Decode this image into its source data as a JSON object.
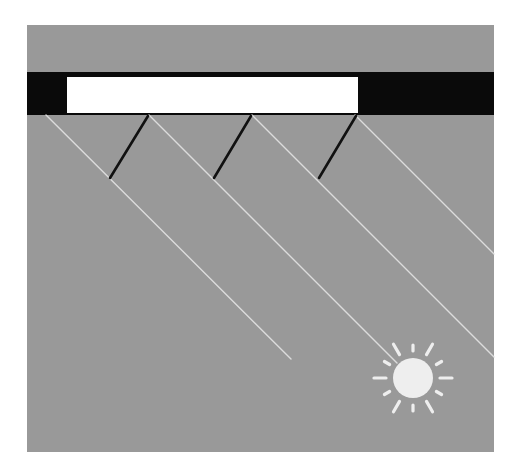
{
  "diagram": {
    "type": "illustration",
    "colors": {
      "background": "#ffffff",
      "panel": "#999999",
      "bar": "#0a0a0a",
      "window": "#ffffff",
      "rays": "#dcdcdc",
      "wavefronts": "#111111",
      "sun": "#eeeeee"
    },
    "elements": {
      "panel": {
        "x": 27,
        "y": 25,
        "w": 467,
        "h": 427
      },
      "bar": {
        "x": 27,
        "y": 72,
        "w": 467,
        "h": 43
      },
      "window": {
        "x": 67,
        "y": 77,
        "w": 291,
        "h": 36
      },
      "rays": [
        {
          "x1": 46,
          "y1": 115,
          "x2": 291,
          "y2": 359
        },
        {
          "x1": 149,
          "y1": 115,
          "x2": 397,
          "y2": 363
        },
        {
          "x1": 252,
          "y1": 115,
          "x2": 494,
          "y2": 357
        },
        {
          "x1": 355,
          "y1": 115,
          "x2": 494,
          "y2": 254
        }
      ],
      "wavefronts": [
        {
          "x1": 148,
          "y1": 116,
          "x2": 110,
          "y2": 178
        },
        {
          "x1": 251,
          "y1": 116,
          "x2": 214,
          "y2": 178
        },
        {
          "x1": 356,
          "y1": 116,
          "x2": 319,
          "y2": 178
        }
      ],
      "sun": {
        "cx": 413,
        "cy": 378,
        "r": 20,
        "ray_count": 12
      }
    }
  }
}
